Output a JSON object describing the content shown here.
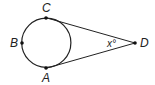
{
  "diagram": {
    "type": "geometry",
    "circle": {
      "cx": 46.3,
      "cy": 42.8,
      "r": 24.6,
      "stroke": "#222222"
    },
    "points": [
      {
        "id": "C",
        "label": "C",
        "x": 46,
        "y": 18,
        "label_x": 42,
        "label_y": 12
      },
      {
        "id": "B",
        "label": "B",
        "x": 22,
        "y": 43,
        "label_x": 10,
        "label_y": 47
      },
      {
        "id": "A",
        "label": "A",
        "x": 46,
        "y": 68,
        "label_x": 42,
        "label_y": 82
      },
      {
        "id": "D",
        "label": "D",
        "x": 135,
        "y": 43,
        "label_x": 140,
        "label_y": 47
      }
    ],
    "segments": [
      {
        "from": "D",
        "to": "C",
        "x1": 135,
        "y1": 43,
        "x2": 47,
        "y2": 18
      },
      {
        "from": "D",
        "to": "A",
        "x1": 135,
        "y1": 43,
        "x2": 47,
        "y2": 68
      }
    ],
    "angle_label": {
      "text": "x°",
      "x": 107,
      "y": 47,
      "vertex": "D"
    }
  }
}
